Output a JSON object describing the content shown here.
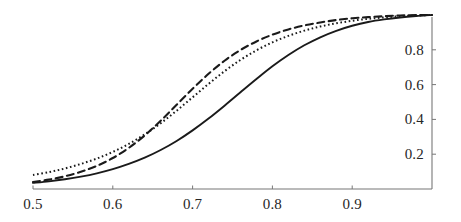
{
  "figure": {
    "background_color": "#ffffff",
    "width": 461,
    "height": 222
  },
  "axes": {
    "x_axis_name": "bottom-axis",
    "y_axis_name": "right-axis",
    "axis_color": "#666666",
    "y_axis_position": "right",
    "x_axis_position": "bottom"
  },
  "chart_data": {
    "type": "line",
    "title": "",
    "subtitle": "",
    "xlabel": "",
    "ylabel": "",
    "xlim": [
      0.5,
      1.0
    ],
    "ylim": [
      0.0,
      1.0
    ],
    "xticks": [
      0.5,
      0.6,
      0.7,
      0.8,
      0.9
    ],
    "xtick_labels": [
      "0.5",
      "0.6",
      "0.7",
      "0.8",
      "0.9"
    ],
    "yticks": [
      0.2,
      0.4,
      0.6,
      0.8
    ],
    "ytick_labels": [
      "0.2",
      "0.4",
      "0.6",
      "0.8"
    ],
    "grid": false,
    "legend": false,
    "legend_position": "none",
    "x": [
      0.5,
      0.52,
      0.54,
      0.56,
      0.58,
      0.6,
      0.62,
      0.64,
      0.66,
      0.68,
      0.7,
      0.72,
      0.74,
      0.76,
      0.78,
      0.8,
      0.82,
      0.84,
      0.86,
      0.88,
      0.9,
      0.92,
      0.94,
      0.96,
      0.98,
      1.0
    ],
    "series": [
      {
        "name": "solid-curve",
        "style": "solid",
        "color": "#1a1a1a",
        "values": [
          0.035,
          0.044,
          0.056,
          0.071,
          0.09,
          0.114,
          0.144,
          0.18,
          0.224,
          0.276,
          0.337,
          0.405,
          0.479,
          0.556,
          0.632,
          0.705,
          0.77,
          0.826,
          0.872,
          0.909,
          0.938,
          0.96,
          0.975,
          0.986,
          0.994,
          1.0
        ]
      },
      {
        "name": "dashed-curve",
        "style": "dashed",
        "color": "#1a1a1a",
        "values": [
          0.04,
          0.054,
          0.073,
          0.099,
          0.133,
          0.178,
          0.236,
          0.308,
          0.392,
          0.484,
          0.576,
          0.662,
          0.737,
          0.799,
          0.848,
          0.887,
          0.917,
          0.94,
          0.957,
          0.971,
          0.981,
          0.988,
          0.993,
          0.997,
          0.999,
          1.0
        ]
      },
      {
        "name": "dotted-curve",
        "style": "dotted",
        "color": "#1a1a1a",
        "values": [
          0.08,
          0.097,
          0.118,
          0.144,
          0.175,
          0.213,
          0.259,
          0.314,
          0.378,
          0.45,
          0.527,
          0.604,
          0.677,
          0.742,
          0.797,
          0.843,
          0.88,
          0.91,
          0.934,
          0.952,
          0.967,
          0.978,
          0.986,
          0.993,
          0.997,
          1.0
        ]
      }
    ]
  }
}
